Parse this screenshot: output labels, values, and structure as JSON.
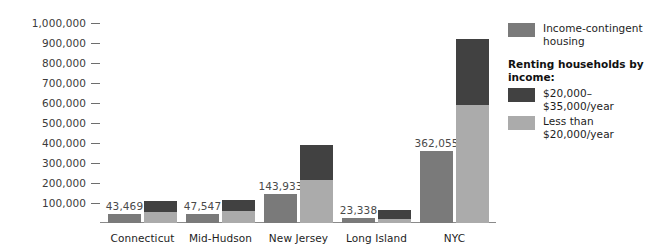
{
  "chart_data": {
    "type": "bar",
    "title": "",
    "xlabel": "",
    "ylabel": "",
    "ylim": [
      0,
      1000000
    ],
    "grid": false,
    "legend_position": "right",
    "categories": [
      "Connecticut",
      "Mid-Hudson",
      "New Jersey",
      "Long Island",
      "NYC"
    ],
    "y_ticks": [
      "1,000,000",
      "900,000",
      "800,000",
      "700,000",
      "600,000",
      "500,000",
      "400,000",
      "300,000",
      "200,000",
      "100,000"
    ],
    "series": [
      {
        "name": "Income-contingent housing",
        "color": "#7a7a7a",
        "values": [
          43469,
          47547,
          143933,
          23338,
          362055
        ],
        "value_labels": [
          "43,469",
          "47,547",
          "143,933",
          "23,338",
          "362,055"
        ]
      },
      {
        "name": "$20,000–$35,000/year",
        "color": "#414141",
        "values": [
          55000,
          57000,
          175000,
          47000,
          330000
        ]
      },
      {
        "name": "Less than $20,000/year",
        "color": "#ababab",
        "values": [
          55000,
          58000,
          215000,
          18000,
          590000
        ]
      }
    ],
    "stacked_totals": [
      110000,
      115000,
      390000,
      65000,
      920000
    ]
  },
  "legend": {
    "income_contingent_label": "Income-contingent housing",
    "heading": "Renting households by income:",
    "mid_income_label": "$20,000–$35,000/year",
    "low_income_label": "Less than $20,000/year"
  },
  "colors": {
    "income_contingent": "#7a7a7a",
    "mid_income": "#414141",
    "low_income": "#ababab",
    "axis": "#8a8a8a",
    "text": "#1d1d1d"
  }
}
